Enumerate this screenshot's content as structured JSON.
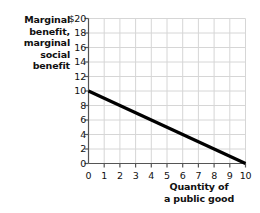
{
  "chart_data": {
    "type": "line",
    "title": "",
    "xlabel": "Quantity of a public good",
    "ylabel": "Marginal benefit, marginal social benefit",
    "xlim": [
      0,
      10
    ],
    "ylim": [
      0,
      20
    ],
    "grid": true,
    "legend": "none",
    "x_ticks": [
      "0",
      "1",
      "2",
      "3",
      "4",
      "5",
      "6",
      "7",
      "8",
      "9",
      "10"
    ],
    "x_tick_values": [
      0,
      1,
      2,
      3,
      4,
      5,
      6,
      7,
      8,
      9,
      10
    ],
    "y_ticks": [
      "$20",
      "18",
      "16",
      "14",
      "12",
      "10",
      "8",
      "6",
      "4",
      "2",
      "0"
    ],
    "y_tick_values": [
      20,
      18,
      16,
      14,
      12,
      10,
      8,
      6,
      4,
      2,
      0
    ],
    "series": [
      {
        "name": "Marginal social benefit",
        "color": "#000000",
        "x": [
          0,
          10
        ],
        "values": [
          10,
          0
        ],
        "points": [
          [
            0,
            10
          ],
          [
            1,
            9
          ],
          [
            2,
            8
          ],
          [
            3,
            7
          ],
          [
            4,
            6
          ],
          [
            5,
            5
          ],
          [
            6,
            4
          ],
          [
            7,
            3
          ],
          [
            8,
            2
          ],
          [
            9,
            1
          ],
          [
            10,
            0
          ]
        ]
      }
    ]
  },
  "axis_titles": {
    "y_lines": [
      "Marginal",
      "benefit,",
      "marginal",
      "social",
      "benefit"
    ],
    "x_lines": [
      "Quantity of",
      "a public good"
    ]
  },
  "colors": {
    "line": "#000000",
    "grid": "#d6d6d6",
    "axis": "#555555",
    "text": "#111111",
    "background": "#ffffff"
  }
}
